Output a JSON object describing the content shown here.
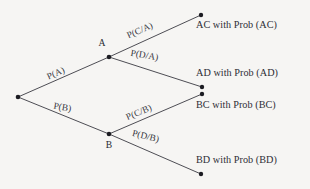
{
  "diagram": {
    "background_color": "#f6f5f3",
    "line_color": "#3a3a42",
    "text_color": "#2d2d35",
    "node_color": "#1c1c22"
  },
  "nodes": {
    "root": {
      "label": "",
      "x": 18,
      "y": 97
    },
    "a": {
      "label": "A",
      "x": 109,
      "y": 57,
      "label_x": 102,
      "label_y": 46
    },
    "b": {
      "label": "B",
      "x": 109,
      "y": 134,
      "label_x": 109,
      "label_y": 148
    }
  },
  "edges": [
    {
      "id": "edge-a",
      "label": "P(A)",
      "from": "root",
      "to": "a",
      "label_x": 57,
      "label_y": 76,
      "rotation": -23.5
    },
    {
      "id": "edge-b",
      "label": "P(B)",
      "from": "root",
      "to": "b",
      "label_x": 62,
      "label_y": 110,
      "rotation": 9
    },
    {
      "id": "edge-ca",
      "label": "P(C/A)",
      "from": "a",
      "to": "ac",
      "label_x": 141,
      "label_y": 33,
      "rotation": -24
    },
    {
      "id": "edge-da",
      "label": "P(D/A)",
      "from": "a",
      "to": "ad",
      "label_x": 144,
      "label_y": 58,
      "rotation": 9.5
    },
    {
      "id": "edge-cb",
      "label": "P(C/B)",
      "from": "b",
      "to": "bc",
      "label_x": 140,
      "label_y": 115,
      "rotation": -23
    },
    {
      "id": "edge-db",
      "label": "P(D/B)",
      "from": "b",
      "to": "bd",
      "label_x": 145,
      "label_y": 139,
      "rotation": 14
    }
  ],
  "outcomes": [
    {
      "id": "outcome-ac",
      "text": "AC with Prob (AC)",
      "dot_x": 201,
      "dot_y": 15,
      "text_x": 196,
      "text_y": 28
    },
    {
      "id": "outcome-ad",
      "text": "AD with Prob (AD)",
      "dot_x": 202,
      "dot_y": 87,
      "text_x": 196,
      "text_y": 76
    },
    {
      "id": "outcome-bc",
      "text": "BC with Prob (BC)",
      "dot_x": 202,
      "dot_y": 94,
      "text_x": 196,
      "text_y": 108
    },
    {
      "id": "outcome-bd",
      "text": "BD with Prob (BD)",
      "dot_x": 201,
      "dot_y": 174,
      "text_x": 196,
      "text_y": 163
    }
  ]
}
